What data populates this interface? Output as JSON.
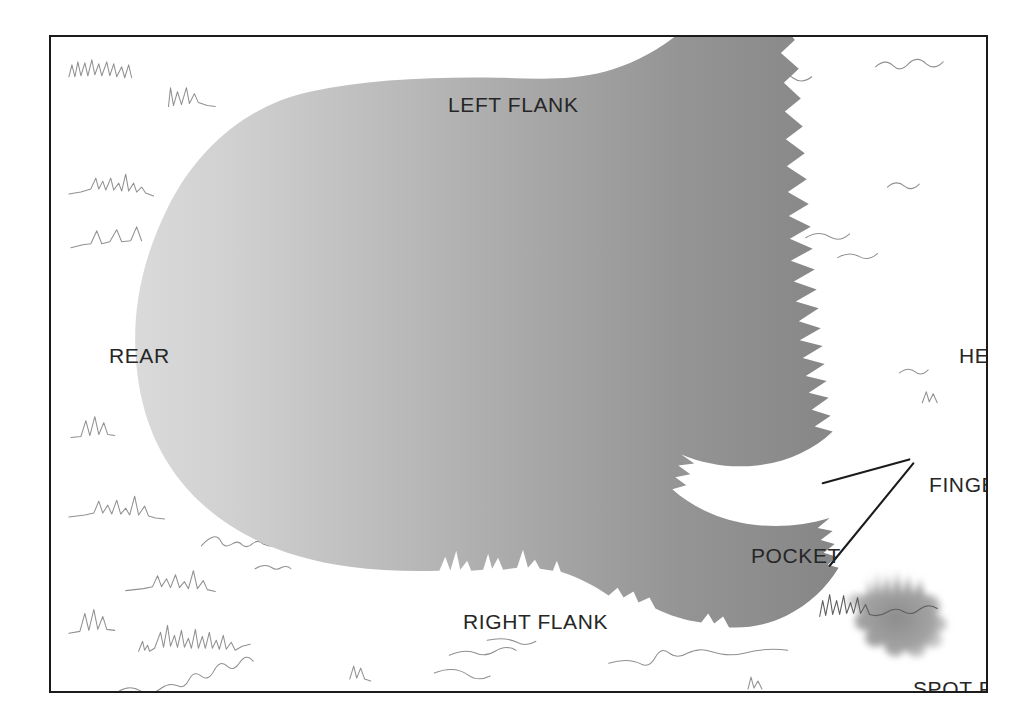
{
  "figure": {
    "border_color": "#1b1b1b",
    "background_color": "#ffffff"
  },
  "labels": {
    "left_flank": "LEFT FLANK",
    "rear": "REAR",
    "head": "HEAD",
    "fingers": "FINGERS",
    "pocket": "POCKET",
    "right_flank": "RIGHT FLANK",
    "spot_fire": "SPOT FIRE"
  },
  "fire": {
    "gradient_start_color": "#d4d4d4",
    "gradient_end_color": "#868686",
    "head_edge": "serrated-flame-spikes",
    "rear_edge": "smooth-rounded",
    "finger_count": 2,
    "pocket_description": "unburned white area between the two fingers"
  },
  "spot_fire": {
    "color": "#9a9a9a",
    "description": "small detached smudged burn patch with upward flame spikes"
  },
  "vegetation": {
    "stroke_color": "#7a7a7a",
    "description": "hand-drawn grass and brush tufts scattered over unburned ground"
  },
  "leaders": {
    "stroke_color": "#1b1b1b",
    "count": 2,
    "description": "two straight leader lines from the FINGERS label to the two finger tips"
  }
}
